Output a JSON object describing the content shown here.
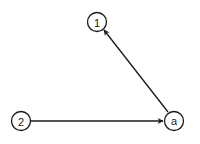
{
  "diagram": {
    "type": "directed-graph",
    "nodes": [
      {
        "id": "n1",
        "label": "1"
      },
      {
        "id": "n2",
        "label": "2"
      },
      {
        "id": "na",
        "label": "a"
      }
    ],
    "edges": [
      {
        "from": "na",
        "to": "n1",
        "directed": true
      },
      {
        "from": "n2",
        "to": "na",
        "directed": true
      }
    ],
    "colors": {
      "stroke": "#1a1a1a",
      "background": "#ffffff"
    }
  }
}
